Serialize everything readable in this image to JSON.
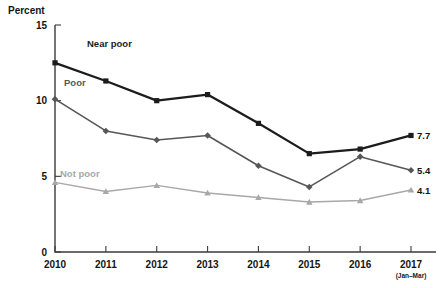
{
  "chart_data": {
    "type": "line",
    "title": "",
    "xlabel": "",
    "ylabel": "Percent",
    "ylim": [
      0,
      15
    ],
    "yticks": [
      0,
      5,
      10,
      15
    ],
    "ytick_labels": [
      "0",
      "5",
      "10",
      "15"
    ],
    "grid": false,
    "legend_position": "inline-labels",
    "categories": [
      "2010",
      "2011",
      "2012",
      "2013",
      "2014",
      "2015",
      "2016",
      "2017"
    ],
    "x_tick_sublabels": [
      "",
      "",
      "",
      "",
      "",
      "",
      "",
      "(Jan–Mar)"
    ],
    "series": [
      {
        "name": "Near poor",
        "color": "#1c1c1c",
        "marker": "square",
        "values": [
          12.5,
          11.3,
          10.0,
          10.4,
          8.5,
          6.5,
          6.8,
          7.7
        ],
        "end_label": "7.7",
        "label_x": 87,
        "label_y": 47
      },
      {
        "name": "Poor",
        "color": "#575757",
        "marker": "diamond",
        "values": [
          10.1,
          8.0,
          7.4,
          7.7,
          5.7,
          4.3,
          6.3,
          5.4
        ],
        "end_label": "5.4",
        "label_x": 64,
        "label_y": 86
      },
      {
        "name": "Not poor",
        "color": "#a8a8a8",
        "marker": "triangle",
        "values": [
          4.6,
          4.0,
          4.4,
          3.9,
          3.6,
          3.3,
          3.4,
          4.1
        ],
        "end_label": "4.1",
        "label_x": 60,
        "label_y": 177
      }
    ]
  },
  "axis": {
    "y_title": "Percent"
  },
  "colors": {
    "near_poor": "#1c1c1c",
    "poor": "#575757",
    "not_poor": "#a8a8a8",
    "axis": "#3b3b3b",
    "background": "#ffffff"
  }
}
